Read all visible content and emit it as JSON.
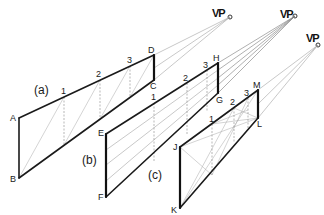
{
  "figure": {
    "vanishing_point_label": "VP",
    "panels": [
      {
        "id": "a",
        "caption": "(a)",
        "corners": {
          "top_left": "A",
          "bottom_left": "B",
          "bottom_right": "C",
          "top_right": "D"
        },
        "divisions": [
          "1",
          "2",
          "3"
        ]
      },
      {
        "id": "b",
        "caption": "(b)",
        "corners": {
          "top_left": "E",
          "bottom_left": "F",
          "bottom_right": "G",
          "top_right": "H"
        },
        "divisions": [
          "1",
          "2",
          "3"
        ]
      },
      {
        "id": "c",
        "caption": "(c)",
        "corners": {
          "top_left": "J",
          "bottom_left": "K",
          "bottom_right": "L",
          "top_right": "M"
        },
        "divisions": [
          "1",
          "2",
          "3"
        ]
      }
    ],
    "vanishing_points": [
      {
        "label": "VP",
        "panel": "a"
      },
      {
        "label": "VP",
        "panel": "b"
      },
      {
        "label": "VP",
        "panel": "c"
      }
    ]
  }
}
